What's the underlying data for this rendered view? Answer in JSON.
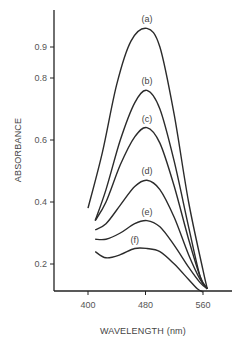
{
  "chart_data": {
    "type": "line",
    "title": "",
    "xlabel": "WAVELENGTH (nm)",
    "ylabel": "ABSORBANCE",
    "xlim": [
      370,
      580
    ],
    "ylim": [
      0.11,
      1.06
    ],
    "x_ticks": [
      400,
      480,
      560
    ],
    "y_ticks": [
      0.2,
      0.4,
      0.6,
      0.8,
      0.9
    ],
    "grid": false,
    "legend": "inline labels above each peak",
    "series": [
      {
        "name": "(a)",
        "points": [
          [
            400,
            0.38
          ],
          [
            420,
            0.56
          ],
          [
            440,
            0.78
          ],
          [
            460,
            0.92
          ],
          [
            482,
            0.96
          ],
          [
            500,
            0.9
          ],
          [
            520,
            0.68
          ],
          [
            540,
            0.4
          ],
          [
            560,
            0.18
          ],
          [
            566,
            0.12
          ]
        ]
      },
      {
        "name": "(b)",
        "points": [
          [
            410,
            0.34
          ],
          [
            425,
            0.44
          ],
          [
            445,
            0.6
          ],
          [
            465,
            0.72
          ],
          [
            482,
            0.76
          ],
          [
            500,
            0.7
          ],
          [
            520,
            0.53
          ],
          [
            540,
            0.32
          ],
          [
            556,
            0.16
          ],
          [
            566,
            0.12
          ]
        ]
      },
      {
        "name": "(c)",
        "points": [
          [
            410,
            0.34
          ],
          [
            425,
            0.4
          ],
          [
            445,
            0.52
          ],
          [
            465,
            0.61
          ],
          [
            482,
            0.64
          ],
          [
            500,
            0.59
          ],
          [
            520,
            0.45
          ],
          [
            540,
            0.28
          ],
          [
            556,
            0.16
          ],
          [
            566,
            0.12
          ]
        ]
      },
      {
        "name": "(d)",
        "points": [
          [
            410,
            0.31
          ],
          [
            425,
            0.33
          ],
          [
            445,
            0.39
          ],
          [
            465,
            0.45
          ],
          [
            482,
            0.47
          ],
          [
            500,
            0.44
          ],
          [
            520,
            0.35
          ],
          [
            540,
            0.23
          ],
          [
            556,
            0.15
          ],
          [
            566,
            0.12
          ]
        ]
      },
      {
        "name": "(e)",
        "points": [
          [
            410,
            0.28
          ],
          [
            425,
            0.28
          ],
          [
            445,
            0.3
          ],
          [
            465,
            0.33
          ],
          [
            482,
            0.34
          ],
          [
            500,
            0.32
          ],
          [
            520,
            0.26
          ],
          [
            540,
            0.19
          ],
          [
            556,
            0.14
          ],
          [
            566,
            0.12
          ]
        ]
      },
      {
        "name": "(f)",
        "points": [
          [
            410,
            0.24
          ],
          [
            425,
            0.22
          ],
          [
            445,
            0.23
          ],
          [
            465,
            0.25
          ],
          [
            482,
            0.25
          ],
          [
            500,
            0.24
          ],
          [
            520,
            0.2
          ],
          [
            540,
            0.15
          ],
          [
            552,
            0.12
          ],
          [
            560,
            0.11
          ]
        ]
      }
    ]
  }
}
